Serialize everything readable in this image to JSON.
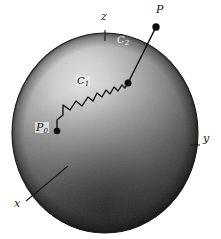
{
  "figure": {
    "background_color": "#ffffff"
  },
  "sphere": {
    "center_x": 105,
    "center_y": 133,
    "radius_x": 93,
    "radius_y": 100,
    "highlight_color": "#d8d8d8",
    "midtone_color": "#8a8a8a",
    "shadow_color": "#2a2a2a",
    "edge_color": "#1c1c1c"
  },
  "axes": [
    {
      "name": "z-axis",
      "label": "z",
      "label_x": 101,
      "label_y": 17,
      "tick_x1": 105,
      "tick_y1": 30,
      "tick_x2": 105,
      "tick_y2": 40
    },
    {
      "name": "y-axis",
      "label": "y",
      "label_x": 203,
      "label_y": 139,
      "tick_x1": 190,
      "tick_y1": 145,
      "tick_x2": 200,
      "tick_y2": 145
    },
    {
      "name": "x-axis",
      "label": "x",
      "label_x": 15,
      "label_y": 205,
      "tick_x1": 26,
      "tick_y1": 201,
      "tick_x2": 68,
      "tick_y2": 166
    }
  ],
  "points": [
    {
      "name": "start-point",
      "label": "P",
      "sub": "0",
      "x": 57,
      "y": 131,
      "radius": 3.2,
      "label_x": 36,
      "label_y": 124
    },
    {
      "name": "surface-exit-point",
      "label": "",
      "sub": "",
      "x": 128,
      "y": 83,
      "radius": 3.4,
      "label_x": 0,
      "label_y": 0
    },
    {
      "name": "end-point",
      "label": "P",
      "sub": "",
      "x": 156,
      "y": 27,
      "radius": 3.6,
      "label_x": 156,
      "label_y": 8
    }
  ],
  "curves": [
    {
      "name": "random-walk-path",
      "label": "C",
      "sub": "1",
      "label_x": 77,
      "label_y": 81,
      "style": "boxed"
    },
    {
      "name": "exit-ray",
      "label": "C",
      "sub": "2",
      "label_x": 117,
      "label_y": 40,
      "style": "on-dark"
    }
  ],
  "paths": {
    "random_walk": "M 57 131 L 57 120 L 63 115 L 63 105 L 70 110 L 76 101 L 82 106 L 88 97 L 93 101 L 97 93 L 102 97 L 106 90 L 110 94 L 114 87 L 118 91 L 122 85 L 125 88 L 128 83",
    "exit_ray": "M 128 83 L 156 27",
    "stroke_color": "#121212",
    "stroke_width": 1.3
  }
}
